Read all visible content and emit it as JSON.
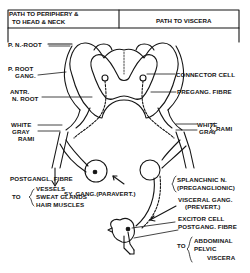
{
  "header": {
    "left_line1": "PATH TO PERIPHERY &",
    "left_line2": "TO HEAD & NECK",
    "right": "PATH TO VISCERA"
  },
  "labels": {
    "p_n_root": "P. N.-ROOT",
    "p_root_gang_1": "P. ROOT",
    "p_root_gang_2": "GANG.",
    "antr_n_root_1": "ANTR.",
    "antr_n_root_2": "N. ROOT",
    "white_left": "WHITE",
    "gray_left": "GRAY",
    "rami_left": "RAMI",
    "connector_cell": "CONNECTOR CELL",
    "pregang_fibre": "PREGANG. FIBRE",
    "white_right": "WHITE",
    "gray_right": "GRAY",
    "rami_right": "RAMI",
    "sy_gang": "SY. GANG.(PARAVERT.)",
    "postgangl_fibre": "POSTGANGL. FIBRE",
    "to_left": "TO",
    "vessels": "VESSELS",
    "sweat_glands": "SWEAT GLANDS",
    "hair_muscles": "HAIR MUSCLES",
    "splanchnic_1": "SPLANCHNIC N.",
    "splanchnic_2": "(PREGANGLIONIC)",
    "visceral_gang_1": "VISCERAL GANG.",
    "visceral_gang_2": "(PREVERT.)",
    "excitor_cell": "EXCITOR CELL",
    "postgang_fibre_right": "POSTGANG. FIBRE",
    "to_right": "TO",
    "abdominal": "ABDOMINAL",
    "pelvic": "PELVIC",
    "viscera": "VISCERA"
  },
  "colors": {
    "ink": "#151515",
    "background": "#ffffff"
  }
}
